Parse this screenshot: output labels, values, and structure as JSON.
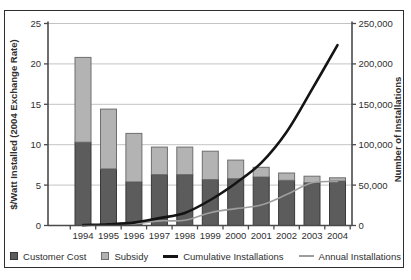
{
  "chart_data": {
    "type": "bar",
    "subtype": "stacked-bar-with-lines-combo",
    "categories": [
      "1994",
      "1995",
      "1996",
      "1997",
      "1998",
      "1999",
      "2000",
      "2001",
      "2002",
      "2003",
      "2004"
    ],
    "bar_series": [
      {
        "name": "Customer Cost",
        "axis": "left",
        "color": "#5c5c5c",
        "border_color": "#383838",
        "values": [
          10.3,
          7.0,
          5.4,
          6.3,
          6.3,
          5.7,
          5.8,
          6.0,
          5.6,
          5.3,
          5.5
        ]
      },
      {
        "name": "Subsidy",
        "axis": "left",
        "color": "#b3b3b3",
        "border_color": "#6e6e6e",
        "values": [
          10.5,
          7.4,
          6.0,
          3.4,
          3.4,
          3.5,
          2.3,
          1.2,
          0.9,
          0.8,
          0.4
        ]
      }
    ],
    "line_series": [
      {
        "name": "Cumulative Installations",
        "axis": "right",
        "color": "#141414",
        "stroke_width": 2.6,
        "values": [
          500,
          1600,
          3600,
          9200,
          15600,
          31500,
          52400,
          77500,
          115800,
          168600,
          223100
        ]
      },
      {
        "name": "Annual Installations",
        "axis": "right",
        "color": "#9e9e9e",
        "stroke_width": 1.6,
        "values": [
          500,
          1100,
          2000,
          5700,
          6400,
          15900,
          20900,
          25200,
          38300,
          52900,
          54500
        ]
      }
    ],
    "left_axis": {
      "label": "$/Watt Installed (2004 Exchange Rate)",
      "min": 0,
      "max": 25,
      "tick_labels": [
        "0",
        "5",
        "10",
        "15",
        "20",
        "25"
      ],
      "tick_values": [
        0,
        5,
        10,
        15,
        20,
        25
      ]
    },
    "right_axis": {
      "label": "Number of Installations",
      "min": 0,
      "max": 250000,
      "tick_labels": [
        "0",
        "50,000",
        "100,000",
        "150,000",
        "200,000",
        "250,000"
      ],
      "tick_values": [
        0,
        50000,
        100000,
        150000,
        200000,
        250000
      ]
    },
    "grid": "horizontal-on",
    "legend_position": "bottom"
  },
  "legend": {
    "items": [
      {
        "label": "Customer Cost",
        "swatch": "square-dark"
      },
      {
        "label": "Subsidy",
        "swatch": "square-light"
      },
      {
        "label": "Cumulative Installations",
        "swatch": "line-black"
      },
      {
        "label": "Annual Installations",
        "swatch": "line-gray"
      }
    ]
  },
  "colors": {
    "frame_border": "#2e2e2e",
    "axis_line": "#4a4a4a",
    "gridline": "#c4c4c4",
    "text": "#2f2f2f",
    "customer_cost_fill": "#5c5c5c",
    "customer_cost_border": "#383838",
    "subsidy_fill": "#b3b3b3",
    "subsidy_border": "#6e6e6e",
    "cumulative_line": "#141414",
    "annual_line": "#9e9e9e"
  }
}
